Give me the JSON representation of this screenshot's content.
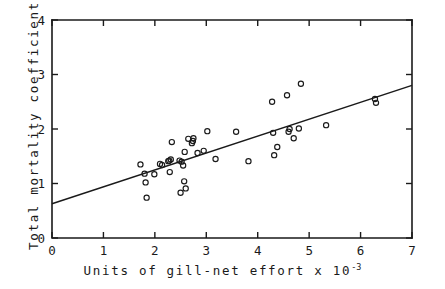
{
  "chart_data": {
    "type": "scatter",
    "title": "",
    "xlabel": "Units  of  gill-net  effort  x  10",
    "xlabel_exponent": "-3",
    "ylabel": "Total  mortality  coefficient",
    "xlim": [
      0,
      7
    ],
    "ylim": [
      0,
      4
    ],
    "xticks": [
      0,
      1,
      2,
      3,
      4,
      5,
      6,
      7
    ],
    "yticks": [
      0,
      1,
      2,
      3,
      4
    ],
    "xtick_labels": [
      "0",
      "1",
      "2",
      "3",
      "4",
      "5",
      "6",
      "7"
    ],
    "ytick_labels": [
      "0",
      "1",
      "2",
      "3",
      "4"
    ],
    "grid": false,
    "legend": false,
    "marker": "open-circle",
    "series": [
      {
        "name": "observations",
        "points": [
          [
            1.72,
            1.35
          ],
          [
            1.8,
            1.18
          ],
          [
            1.82,
            1.02
          ],
          [
            1.84,
            0.74
          ],
          [
            1.99,
            1.17
          ],
          [
            2.1,
            1.36
          ],
          [
            2.14,
            1.34
          ],
          [
            2.26,
            1.41
          ],
          [
            2.28,
            1.42
          ],
          [
            2.29,
            1.21
          ],
          [
            2.31,
            1.44
          ],
          [
            2.33,
            1.76
          ],
          [
            2.48,
            1.42
          ],
          [
            2.5,
            0.83
          ],
          [
            2.52,
            1.4
          ],
          [
            2.55,
            1.33
          ],
          [
            2.57,
            1.04
          ],
          [
            2.58,
            1.58
          ],
          [
            2.6,
            0.91
          ],
          [
            2.65,
            1.82
          ],
          [
            2.72,
            1.74
          ],
          [
            2.74,
            1.78
          ],
          [
            2.75,
            1.83
          ],
          [
            2.83,
            1.56
          ],
          [
            2.95,
            1.6
          ],
          [
            3.02,
            1.96
          ],
          [
            3.18,
            1.45
          ],
          [
            3.58,
            1.95
          ],
          [
            3.82,
            1.41
          ],
          [
            4.28,
            2.5
          ],
          [
            4.3,
            1.93
          ],
          [
            4.32,
            1.52
          ],
          [
            4.38,
            1.67
          ],
          [
            4.57,
            2.62
          ],
          [
            4.6,
            1.95
          ],
          [
            4.62,
            2.0
          ],
          [
            4.7,
            1.83
          ],
          [
            4.8,
            2.01
          ],
          [
            4.84,
            2.83
          ],
          [
            5.33,
            2.07
          ],
          [
            6.28,
            2.55
          ],
          [
            6.3,
            2.48
          ]
        ]
      }
    ],
    "fit_line": {
      "name": "regression-line",
      "x_start": 0,
      "y_start": 0.63,
      "x_end": 7,
      "y_end": 2.8
    }
  }
}
